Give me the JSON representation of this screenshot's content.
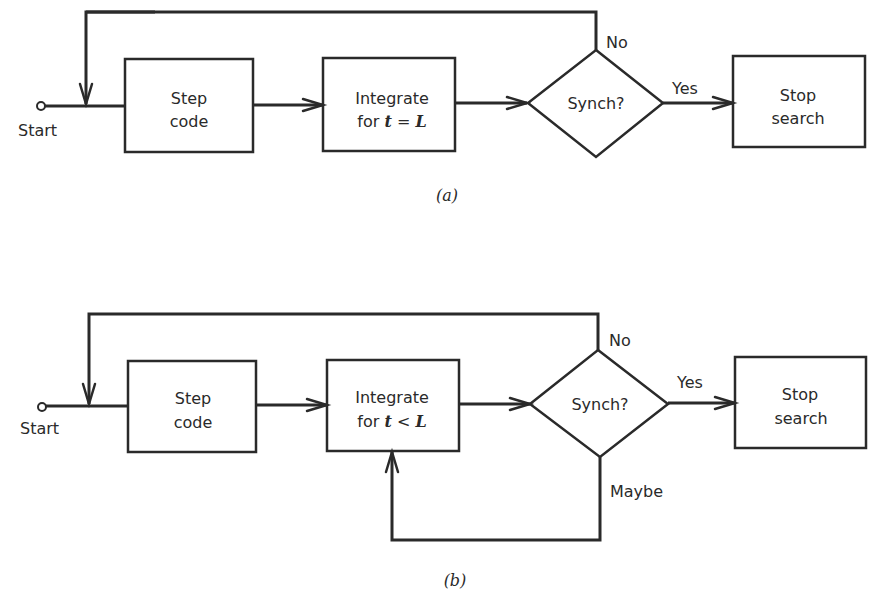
{
  "diagram_a": {
    "start_label": "Start",
    "step_box": {
      "line1": "Step",
      "line2": "code"
    },
    "integrate_box": {
      "line1": "Integrate",
      "line2_prefix": "for ",
      "var_t": "t",
      "op": " = ",
      "var_L": "L"
    },
    "decision": "Synch?",
    "no_label": "No",
    "yes_label": "Yes",
    "stop_box": {
      "line1": "Stop",
      "line2": "search"
    },
    "caption": "(a)"
  },
  "diagram_b": {
    "start_label": "Start",
    "step_box": {
      "line1": "Step",
      "line2": "code"
    },
    "integrate_box": {
      "line1": "Integrate",
      "line2_prefix": "for ",
      "var_t": "t",
      "op": " < ",
      "var_L": "L"
    },
    "decision": "Synch?",
    "no_label": "No",
    "yes_label": "Yes",
    "maybe_label": "Maybe",
    "stop_box": {
      "line1": "Stop",
      "line2": "search"
    },
    "caption": "(b)"
  }
}
